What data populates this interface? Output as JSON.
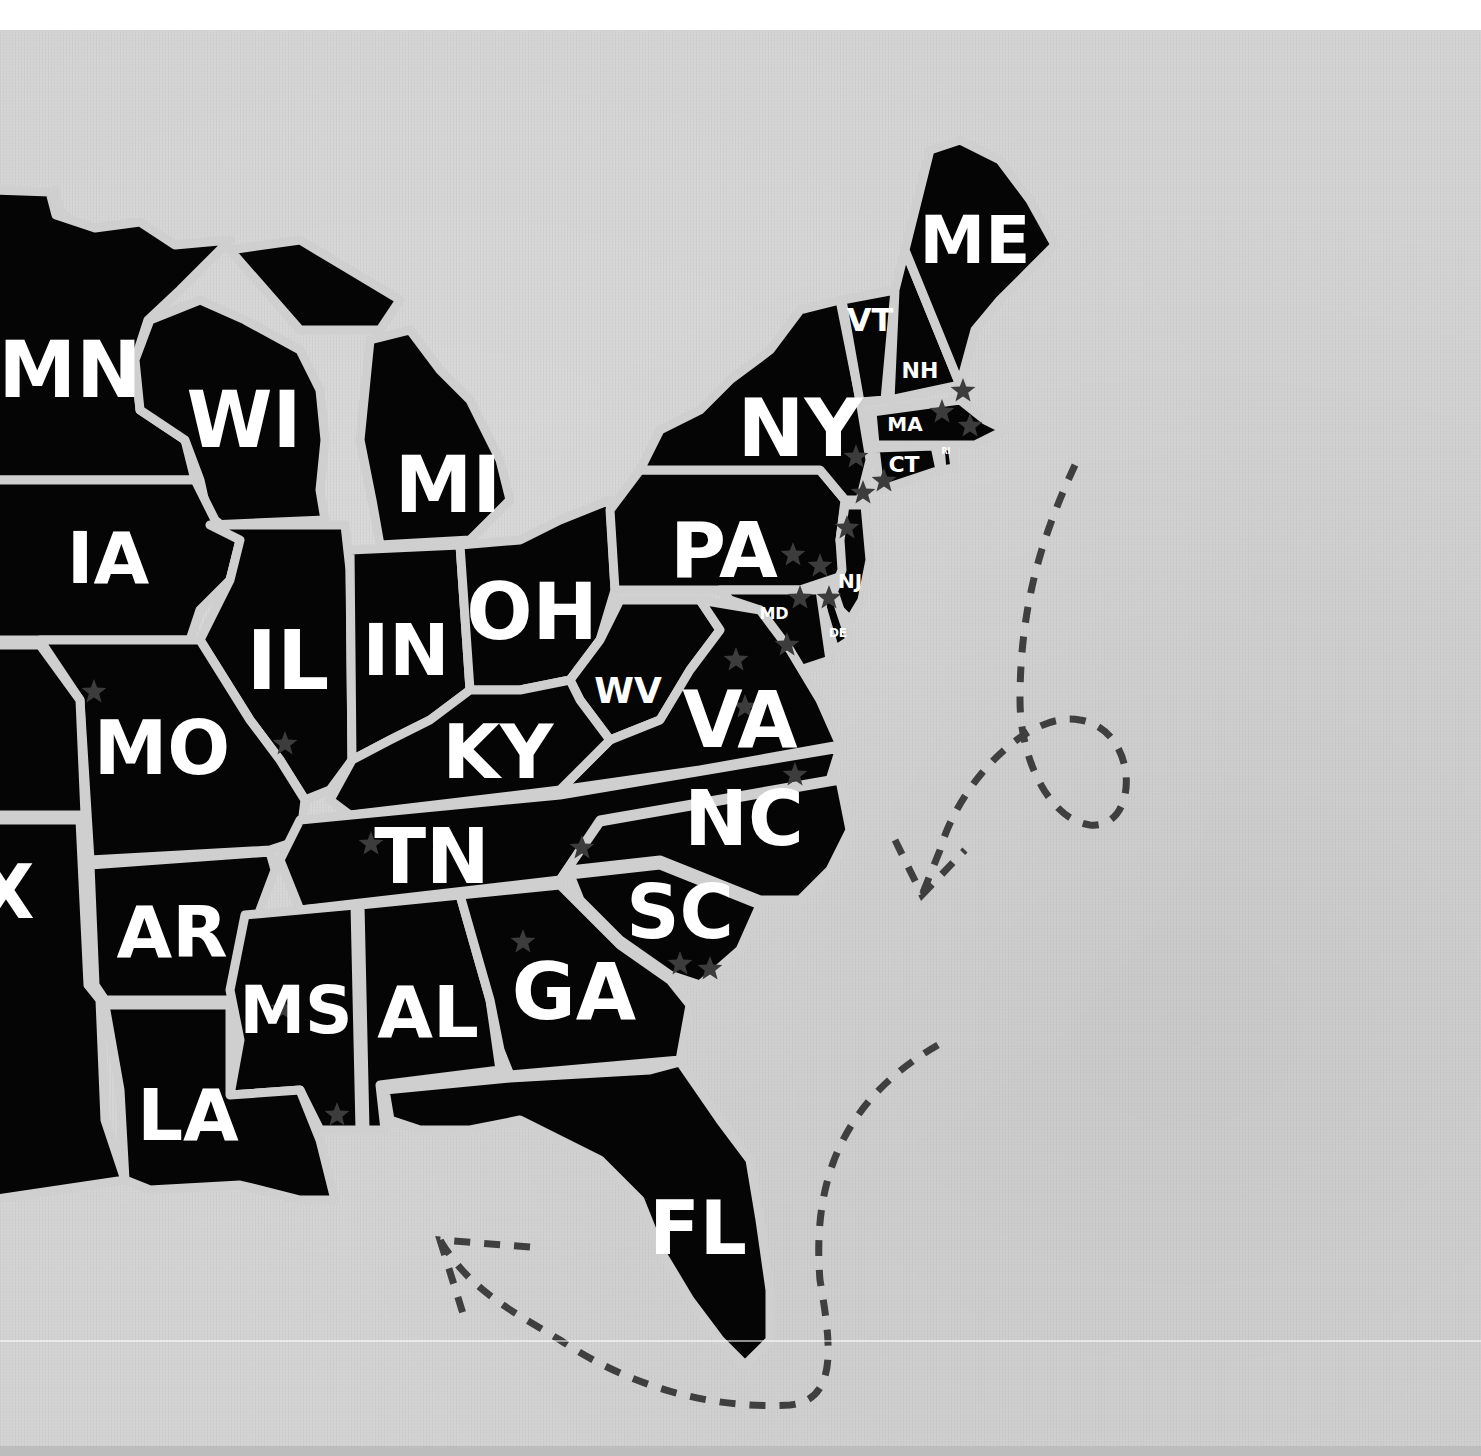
{
  "map": {
    "title": "Eastern United States states map",
    "colors": {
      "land": "#050505",
      "border": "#cfcfcf",
      "background": "#d3d3d3",
      "label": "#ffffff",
      "star": "#3c3c3c",
      "route": "#3f3f3f"
    },
    "states": [
      {
        "code": "MN",
        "x": 70,
        "y": 370,
        "size": 78
      },
      {
        "code": "WI",
        "x": 244,
        "y": 420,
        "size": 78
      },
      {
        "code": "MI",
        "x": 448,
        "y": 485,
        "size": 78
      },
      {
        "code": "IA",
        "x": 108,
        "y": 558,
        "size": 72
      },
      {
        "code": "IL",
        "x": 288,
        "y": 660,
        "size": 82
      },
      {
        "code": "IN",
        "x": 406,
        "y": 650,
        "size": 72
      },
      {
        "code": "OH",
        "x": 532,
        "y": 612,
        "size": 78
      },
      {
        "code": "PA",
        "x": 724,
        "y": 550,
        "size": 76
      },
      {
        "code": "NY",
        "x": 800,
        "y": 428,
        "size": 80
      },
      {
        "code": "ME",
        "x": 975,
        "y": 240,
        "size": 66
      },
      {
        "code": "VT",
        "x": 870,
        "y": 320,
        "size": 32
      },
      {
        "code": "NH",
        "x": 920,
        "y": 370,
        "size": 22
      },
      {
        "code": "MA",
        "x": 905,
        "y": 424,
        "size": 20
      },
      {
        "code": "CT",
        "x": 904,
        "y": 464,
        "size": 22
      },
      {
        "code": "RI",
        "x": 946,
        "y": 451,
        "size": 8
      },
      {
        "code": "NJ",
        "x": 850,
        "y": 581,
        "size": 20
      },
      {
        "code": "MD",
        "x": 774,
        "y": 613,
        "size": 16
      },
      {
        "code": "DE",
        "x": 838,
        "y": 633,
        "size": 12
      },
      {
        "code": "WV",
        "x": 628,
        "y": 690,
        "size": 36
      },
      {
        "code": "VA",
        "x": 740,
        "y": 720,
        "size": 78
      },
      {
        "code": "KY",
        "x": 498,
        "y": 752,
        "size": 74
      },
      {
        "code": "MO",
        "x": 162,
        "y": 748,
        "size": 74
      },
      {
        "code": "TN",
        "x": 432,
        "y": 856,
        "size": 76
      },
      {
        "code": "NC",
        "x": 744,
        "y": 818,
        "size": 76
      },
      {
        "code": "SC",
        "x": 680,
        "y": 912,
        "size": 74
      },
      {
        "code": "AR",
        "x": 172,
        "y": 932,
        "size": 72
      },
      {
        "code": "MS",
        "x": 296,
        "y": 1010,
        "size": 66
      },
      {
        "code": "AL",
        "x": 428,
        "y": 1012,
        "size": 72
      },
      {
        "code": "GA",
        "x": 574,
        "y": 992,
        "size": 78
      },
      {
        "code": "LA",
        "x": 188,
        "y": 1115,
        "size": 72
      },
      {
        "code": "FL",
        "x": 698,
        "y": 1228,
        "size": 74
      },
      {
        "code": "X",
        "x": 6,
        "y": 892,
        "size": 74
      }
    ],
    "stars": [
      {
        "x": 94,
        "y": 692
      },
      {
        "x": 285,
        "y": 744
      },
      {
        "x": 371,
        "y": 844
      },
      {
        "x": 283,
        "y": 1009
      },
      {
        "x": 337,
        "y": 1115
      },
      {
        "x": 523,
        "y": 942
      },
      {
        "x": 680,
        "y": 964
      },
      {
        "x": 710,
        "y": 969
      },
      {
        "x": 582,
        "y": 848
      },
      {
        "x": 795,
        "y": 775
      },
      {
        "x": 745,
        "y": 707
      },
      {
        "x": 736,
        "y": 660
      },
      {
        "x": 787,
        "y": 645
      },
      {
        "x": 800,
        "y": 598
      },
      {
        "x": 829,
        "y": 598
      },
      {
        "x": 793,
        "y": 555
      },
      {
        "x": 820,
        "y": 566
      },
      {
        "x": 847,
        "y": 528
      },
      {
        "x": 856,
        "y": 457
      },
      {
        "x": 863,
        "y": 493
      },
      {
        "x": 884,
        "y": 481
      },
      {
        "x": 963,
        "y": 391
      },
      {
        "x": 942,
        "y": 412
      },
      {
        "x": 970,
        "y": 426
      }
    ],
    "route_legend": "dashed travel route"
  }
}
